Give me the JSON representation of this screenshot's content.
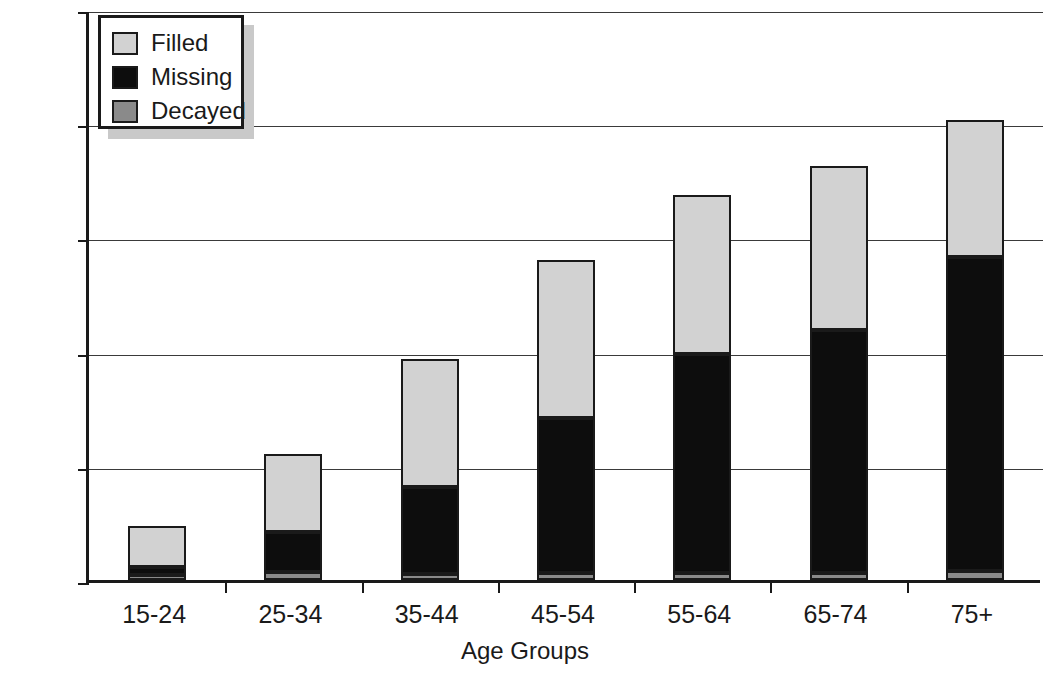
{
  "chart_data": {
    "type": "bar",
    "subtype": "stacked-bar",
    "title": "",
    "xlabel": "Age Groups",
    "ylabel": "Mean DMFS",
    "categories": [
      "15-24",
      "25-34",
      "35-44",
      "45-54",
      "55-64",
      "65-74",
      "75+"
    ],
    "series": [
      {
        "name": "Decayed",
        "color": "#8a8a8a",
        "values": [
          0.9,
          1.4,
          1.0,
          1.2,
          1.2,
          1.2,
          1.5
        ]
      },
      {
        "name": "Missing",
        "color": "#0d0d0d",
        "values": [
          1.4,
          7.0,
          15.3,
          27.2,
          38.3,
          42.5,
          55.1
        ]
      },
      {
        "name": "Filled",
        "color": "#d2d2d2",
        "values": [
          7.1,
          13.6,
          22.4,
          27.6,
          28.0,
          28.8,
          23.9
        ]
      }
    ],
    "stack_order_bottom_to_top": [
      "Decayed",
      "Missing",
      "Filled"
    ],
    "totals": [
      9.4,
      22.0,
      38.7,
      56.0,
      67.5,
      72.5,
      80.5
    ],
    "ylim": [
      0,
      100
    ],
    "yticks": [
      0,
      20,
      40,
      60,
      80,
      100
    ],
    "ytick_labels": [
      "0",
      "20",
      "40",
      "60",
      "80",
      "100"
    ],
    "grid": true,
    "grid_axis": "y",
    "legend": {
      "position": "top-left-inside",
      "entries": [
        {
          "label": "Filled",
          "color": "#d2d2d2"
        },
        {
          "label": "Missing",
          "color": "#0d0d0d"
        },
        {
          "label": "Decayed",
          "color": "#8a8a8a"
        }
      ]
    }
  },
  "axes": {
    "y_title": "Mean DMFS",
    "x_title": "Age Groups"
  }
}
